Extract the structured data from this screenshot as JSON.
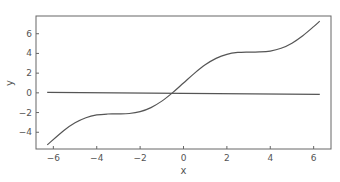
{
  "chart_data": {
    "type": "line",
    "title": "",
    "xlabel": "x",
    "ylabel": "y",
    "xlim": [
      -6.8,
      6.8
    ],
    "ylim": [
      -5.7,
      7.8
    ],
    "grid": false,
    "legend": null,
    "xticks": [
      -6,
      -4,
      -2,
      0,
      2,
      4,
      6
    ],
    "yticks": [
      -4,
      -2,
      0,
      2,
      4,
      6
    ],
    "series": [
      {
        "name": "curve",
        "color": "#555555",
        "x": [
          -6.283,
          -5.5,
          -5,
          -4.5,
          -4,
          -3.5,
          -3,
          -2.5,
          -2,
          -1.5,
          -1,
          -0.5,
          0,
          0.5,
          1,
          1.5,
          2,
          2.5,
          3,
          3.5,
          4,
          4.5,
          5,
          5.5,
          6,
          6.283
        ],
        "y": [
          -5.283,
          -3.795,
          -3.041,
          -2.523,
          -2.243,
          -2.149,
          -2.141,
          -2.098,
          -1.909,
          -1.497,
          -0.841,
          0.021,
          1.0,
          1.979,
          2.841,
          3.497,
          3.909,
          4.098,
          4.141,
          4.149,
          4.243,
          4.523,
          5.041,
          5.795,
          6.721,
          7.283
        ]
      },
      {
        "name": "flat-line",
        "color": "#555555",
        "x": [
          -6.283,
          6.283
        ],
        "y": [
          0.05,
          -0.15
        ]
      }
    ]
  },
  "axes": {
    "xlabel": "x",
    "ylabel": "y"
  }
}
